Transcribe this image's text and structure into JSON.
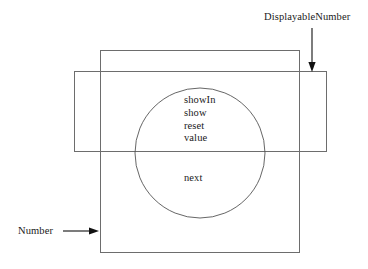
{
  "diagram": {
    "labels": {
      "displayable_number": "DisplayableNumber",
      "number": "Number"
    },
    "shapes": {
      "number_rect": {
        "name": "Number",
        "x": 100,
        "y": 50,
        "width": 200,
        "height": 203,
        "stroke": "#6d6d6d"
      },
      "displayable_number_rect": {
        "name": "DisplayableNumber",
        "x": 74,
        "y": 71,
        "width": 253,
        "height": 81,
        "stroke": "#6d6d6d"
      },
      "intersection_circle": {
        "name": "intersection",
        "cx": 200,
        "cy": 153,
        "r": 65,
        "stroke": "#555555"
      }
    },
    "annotations": {
      "displayable_number_arrow": {
        "direction": "down",
        "x1": 312,
        "y1": 28,
        "x2": 312,
        "y2": 70
      },
      "number_arrow": {
        "direction": "right",
        "x1": 64,
        "y1": 231,
        "x2": 98,
        "y2": 231
      }
    },
    "members_upper": [
      "showIn",
      "show",
      "reset",
      "value"
    ],
    "members_lower": [
      "next"
    ]
  },
  "colors": {
    "background": "#ffffff",
    "rect_stroke": "#6d6d6d",
    "circle_stroke": "#555555",
    "arrow": "#111111",
    "text": "#1a1a1a"
  }
}
